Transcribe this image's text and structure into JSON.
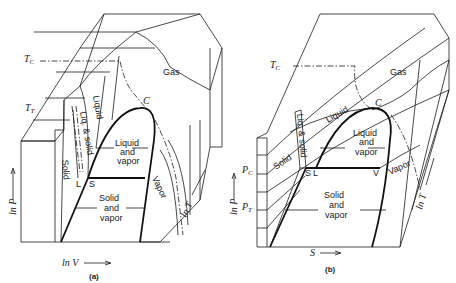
{
  "panel_a": {
    "caption": "(a)",
    "regions": {
      "gas": "Gas",
      "liquid": "Liquid",
      "liq_solid": "Liq. & solid",
      "solid": "Solid",
      "liquid_vapor_1": "Liquid",
      "liquid_vapor_2": "and",
      "liquid_vapor_3": "vapor",
      "solid_vapor_1": "Solid",
      "solid_vapor_2": "and",
      "solid_vapor_3": "vapor",
      "vapor": "Vapor"
    },
    "points": {
      "critical": "C",
      "solid": "S",
      "liquid": "L",
      "vapor": "V"
    },
    "labels": {
      "tc": "T",
      "tc_sub": "C",
      "tt": "T",
      "tt_sub": "T"
    },
    "axes": {
      "y": "ln P",
      "x": "ln V",
      "z": "ln T"
    }
  },
  "panel_b": {
    "caption": "(b)",
    "regions": {
      "gas": "Gas",
      "liquid": "Liquid",
      "liq_solid": "Liq. & solid",
      "solid": "Solid",
      "liquid_vapor_1": "Liquid",
      "liquid_vapor_2": "and",
      "liquid_vapor_3": "vapor",
      "solid_vapor_1": "Solid",
      "solid_vapor_2": "and",
      "solid_vapor_3": "vapor",
      "vapor": "Vapor"
    },
    "points": {
      "critical": "C",
      "solid": "S",
      "liquid": "L",
      "vapor": "V"
    },
    "labels": {
      "tc": "T",
      "tc_sub": "C",
      "pc": "P",
      "pc_sub": "C",
      "pt": "P",
      "pt_sub": "T"
    },
    "axes": {
      "y": "ln P",
      "x": "S",
      "z": "ln T"
    }
  }
}
